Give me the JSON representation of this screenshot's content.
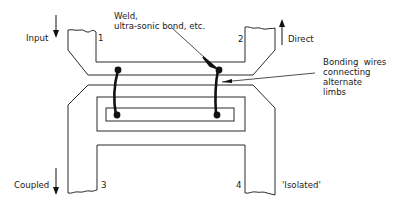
{
  "diagram": {
    "ports": [
      {
        "number": "1",
        "label": "Input",
        "arrow": "down"
      },
      {
        "number": "2",
        "label": "Direct",
        "arrow": "up"
      },
      {
        "number": "3",
        "label": "Coupled",
        "arrow": "down"
      },
      {
        "number": "4",
        "label": "'Isolated'",
        "arrow": "none"
      }
    ],
    "annotations": {
      "weld_line1": "Weld,",
      "weld_line2": "ultra-sonic bond, etc.",
      "bonding_line1": "Bonding  wires",
      "bonding_line2": "connecting",
      "bonding_line3": "alternate",
      "bonding_line4": "limbs"
    },
    "colors": {
      "line": "#2a2a2a",
      "wire": "#111111",
      "background": "#ffffff"
    }
  }
}
